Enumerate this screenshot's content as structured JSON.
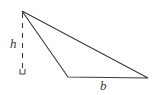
{
  "figure": {
    "kind": "geometry-diagram",
    "width": 155,
    "height": 95,
    "background_color": "#ffffff",
    "stroke_color": "#3a3a3a",
    "labels": {
      "height": "h",
      "base": "b"
    },
    "labels_list": [
      {
        "name": "height-label",
        "text": "h",
        "x": 10,
        "y": 48
      },
      {
        "name": "base-label",
        "text": "b",
        "x": 100,
        "y": 90
      }
    ],
    "vertices": {
      "apex": {
        "x": 22,
        "y": 11
      },
      "bottom_left": {
        "x": 68,
        "y": 77
      },
      "bottom_right": {
        "x": 148,
        "y": 78
      }
    },
    "altitude": {
      "from": {
        "x": 22.5,
        "y": 13
      },
      "to": {
        "x": 22.5,
        "y": 69
      },
      "style": "dashed",
      "dash_pattern": "5 5"
    },
    "right_angle_marker": {
      "x": 20,
      "y": 69,
      "size": 5
    }
  }
}
